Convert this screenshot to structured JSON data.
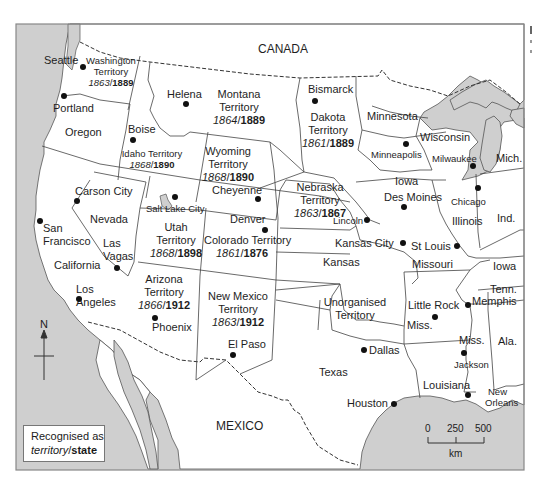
{
  "map": {
    "colors": {
      "water": "#cfcfcf",
      "land": "#ffffff",
      "border": "#444444",
      "frame": "#888888"
    },
    "countries": {
      "north": "CANADA",
      "south": "MEXICO"
    },
    "territories": [
      {
        "name": "Washington",
        "suffix": "Territory",
        "territory_year": "1863",
        "state_year": "1889"
      },
      {
        "name": "Montana",
        "suffix": "Territory",
        "territory_year": "1864",
        "state_year": "1889"
      },
      {
        "name": "Dakota",
        "suffix": "Territory",
        "territory_year": "1861",
        "state_year": "1889"
      },
      {
        "name": "Idaho Territory",
        "territory_year": "1868",
        "state_year": "1890"
      },
      {
        "name": "Wyoming",
        "suffix": "Territory",
        "territory_year": "1868",
        "state_year": "1890"
      },
      {
        "name": "Nebraska",
        "suffix": "Territory",
        "territory_year": "1863",
        "state_year": "1867"
      },
      {
        "name": "Utah",
        "suffix": "Territory",
        "territory_year": "1868",
        "state_year": "1898"
      },
      {
        "name": "Colorado Territory",
        "territory_year": "1861",
        "state_year": "1876"
      },
      {
        "name": "Arizona",
        "suffix": "Territory",
        "territory_year": "1866",
        "state_year": "1912"
      },
      {
        "name": "New Mexico",
        "suffix": "Territory",
        "territory_year": "1863",
        "state_year": "1912"
      }
    ],
    "states": [
      "Oregon",
      "Nevada",
      "California",
      "Minnesota",
      "Wisconsin",
      "Mich.",
      "Iowa",
      "Illinois",
      "Ind.",
      "Kansas",
      "Missouri",
      "Iowa",
      "Tenn.",
      "Arkansas",
      "Miss.",
      "Ala.",
      "Louisiana",
      "Texas"
    ],
    "regions": [
      "Unorganised",
      "Territory"
    ],
    "cities": [
      "Seattle",
      "Portland",
      "Helena",
      "Boise",
      "Bismarck",
      "Minneapolis",
      "Milwaukee",
      "Chicago",
      "Carson City",
      "Salt Lake City",
      "Cheyenne",
      "Lincoln",
      "Des Moines",
      "San",
      "Francisco",
      "Las",
      "Vagas",
      "Denver",
      "Kansas City",
      "St Louis",
      "Los",
      "Angeles",
      "Phoenix",
      "El Paso",
      "Little Rock",
      "Memphis",
      "Jackson",
      "Dallas",
      "Houston",
      "New",
      "Orleans"
    ],
    "compass": {
      "label": "N"
    },
    "legend": {
      "line1": "Recognised as",
      "territory_word": "territory",
      "slash": "/",
      "state_word": "state"
    },
    "scale": {
      "ticks": [
        "0",
        "250",
        "500"
      ],
      "unit": "km"
    }
  }
}
